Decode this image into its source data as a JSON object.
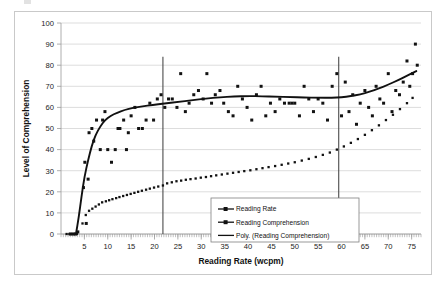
{
  "chart_data": {
    "type": "scatter",
    "title": "",
    "xlabel": "Reading Rate (wcpm)",
    "ylabel": "Level of Comprehension",
    "xlim": [
      0,
      77
    ],
    "ylim": [
      0,
      100
    ],
    "xticks": [
      5,
      10,
      15,
      20,
      25,
      30,
      35,
      40,
      45,
      50,
      55,
      60,
      65,
      70,
      75
    ],
    "yticks": [
      0,
      10,
      20,
      30,
      40,
      50,
      60,
      70,
      80,
      90,
      100
    ],
    "grid": true,
    "legend_position": "inside-bottom-right",
    "legend": [
      "Reading Rate",
      "Reading Comprehension",
      "Poly. (Reading Comprehension)"
    ],
    "annotations": [
      {
        "name": "vertical-reference-line-low",
        "x": 21.8
      },
      {
        "name": "vertical-reference-line-high",
        "x": 59.4
      }
    ],
    "series": [
      {
        "name": "Reading Rate",
        "style": "dotted-markers",
        "points": [
          [
            1.2,
            0
          ],
          [
            1.8,
            0
          ],
          [
            2.3,
            0
          ],
          [
            2.8,
            0
          ],
          [
            3.4,
            0
          ],
          [
            4.6,
            5
          ],
          [
            5.3,
            9
          ],
          [
            6.0,
            11
          ],
          [
            6.7,
            12
          ],
          [
            7.4,
            13
          ],
          [
            8.1,
            14
          ],
          [
            8.8,
            15
          ],
          [
            9.6,
            15.5
          ],
          [
            10.3,
            16
          ],
          [
            11.0,
            16.5
          ],
          [
            11.8,
            17
          ],
          [
            12.5,
            17.5
          ],
          [
            13.3,
            18
          ],
          [
            14.1,
            18.5
          ],
          [
            14.9,
            19
          ],
          [
            15.7,
            19.5
          ],
          [
            16.5,
            20
          ],
          [
            17.3,
            20.5
          ],
          [
            18.2,
            21
          ],
          [
            19.0,
            21.5
          ],
          [
            19.9,
            22
          ],
          [
            20.8,
            22.5
          ],
          [
            21.8,
            23
          ],
          [
            22.7,
            24
          ],
          [
            23.7,
            24.5
          ],
          [
            24.7,
            25
          ],
          [
            25.7,
            25.3
          ],
          [
            26.7,
            25.7
          ],
          [
            27.7,
            26
          ],
          [
            28.8,
            26.3
          ],
          [
            29.9,
            26.7
          ],
          [
            31.0,
            27
          ],
          [
            32.1,
            27.4
          ],
          [
            33.2,
            27.8
          ],
          [
            34.4,
            28.2
          ],
          [
            35.6,
            28.6
          ],
          [
            36.8,
            29
          ],
          [
            38.0,
            29.4
          ],
          [
            39.2,
            29.8
          ],
          [
            40.5,
            30.2
          ],
          [
            41.8,
            30.7
          ],
          [
            43.1,
            31.2
          ],
          [
            44.4,
            31.7
          ],
          [
            45.8,
            32.2
          ],
          [
            47.2,
            32.8
          ],
          [
            48.6,
            33.4
          ],
          [
            50.0,
            34
          ],
          [
            51.5,
            34.8
          ],
          [
            53.0,
            35.6
          ],
          [
            54.5,
            36.5
          ],
          [
            56.0,
            37.5
          ],
          [
            57.5,
            38.6
          ],
          [
            59.0,
            40
          ],
          [
            60.5,
            41.5
          ],
          [
            62.0,
            43.2
          ],
          [
            63.5,
            45
          ],
          [
            65.0,
            47
          ],
          [
            66.5,
            49.2
          ],
          [
            68.0,
            51.5
          ],
          [
            69.5,
            54
          ],
          [
            71.0,
            56.5
          ],
          [
            72.5,
            59.2
          ],
          [
            74.0,
            62
          ],
          [
            75.2,
            64.5
          ]
        ]
      },
      {
        "name": "Reading Comprehension",
        "style": "scatter-markers",
        "points": [
          [
            2.0,
            0
          ],
          [
            2.6,
            0
          ],
          [
            3.1,
            0
          ],
          [
            3.6,
            1
          ],
          [
            4.8,
            22
          ],
          [
            5.1,
            34
          ],
          [
            5.4,
            5
          ],
          [
            5.8,
            26
          ],
          [
            6.0,
            48
          ],
          [
            6.6,
            50
          ],
          [
            7.0,
            44
          ],
          [
            7.6,
            54
          ],
          [
            8.4,
            40
          ],
          [
            8.9,
            54
          ],
          [
            9.4,
            58
          ],
          [
            10.0,
            40
          ],
          [
            10.8,
            34
          ],
          [
            11.6,
            40
          ],
          [
            12.2,
            50
          ],
          [
            12.6,
            50
          ],
          [
            13.4,
            54
          ],
          [
            14.0,
            40
          ],
          [
            14.4,
            48
          ],
          [
            15.0,
            56
          ],
          [
            15.8,
            60
          ],
          [
            16.6,
            50
          ],
          [
            17.4,
            50
          ],
          [
            18.2,
            54
          ],
          [
            19.0,
            62
          ],
          [
            19.8,
            54
          ],
          [
            20.6,
            64
          ],
          [
            21.4,
            66
          ],
          [
            22.2,
            60
          ],
          [
            23.0,
            64
          ],
          [
            23.8,
            64
          ],
          [
            24.8,
            60
          ],
          [
            25.6,
            76
          ],
          [
            26.6,
            58
          ],
          [
            27.4,
            62
          ],
          [
            28.4,
            66
          ],
          [
            29.4,
            68
          ],
          [
            30.4,
            64
          ],
          [
            31.2,
            76
          ],
          [
            32.2,
            62
          ],
          [
            33.0,
            66
          ],
          [
            34.0,
            68
          ],
          [
            34.8,
            62
          ],
          [
            35.8,
            58
          ],
          [
            36.8,
            56
          ],
          [
            37.8,
            70
          ],
          [
            38.8,
            64
          ],
          [
            39.8,
            60
          ],
          [
            40.8,
            54
          ],
          [
            41.8,
            66
          ],
          [
            42.8,
            70
          ],
          [
            43.8,
            56
          ],
          [
            44.8,
            62
          ],
          [
            45.8,
            58
          ],
          [
            46.8,
            64
          ],
          [
            47.8,
            62
          ],
          [
            48.8,
            62
          ],
          [
            49.4,
            62
          ],
          [
            50.0,
            62
          ],
          [
            51.0,
            56
          ],
          [
            52.0,
            70
          ],
          [
            53.0,
            64
          ],
          [
            54.0,
            58
          ],
          [
            55.0,
            64
          ],
          [
            56.0,
            62
          ],
          [
            57.0,
            54
          ],
          [
            58.0,
            70
          ],
          [
            59.0,
            76
          ],
          [
            60.0,
            56
          ],
          [
            60.8,
            72
          ],
          [
            61.6,
            58
          ],
          [
            62.4,
            66
          ],
          [
            63.2,
            52
          ],
          [
            64.0,
            62
          ],
          [
            65.0,
            68
          ],
          [
            65.8,
            60
          ],
          [
            66.6,
            56
          ],
          [
            67.4,
            70
          ],
          [
            68.2,
            64
          ],
          [
            69.0,
            62
          ],
          [
            70.0,
            76
          ],
          [
            70.8,
            58
          ],
          [
            71.6,
            68
          ],
          [
            72.4,
            66
          ],
          [
            73.2,
            72
          ],
          [
            74.0,
            82
          ],
          [
            74.6,
            70
          ],
          [
            75.2,
            76
          ],
          [
            75.8,
            90
          ],
          [
            76.2,
            80
          ]
        ]
      },
      {
        "name": "Poly. (Reading Comprehension)",
        "style": "smooth-line",
        "points": [
          [
            3.2,
            0
          ],
          [
            3.8,
            8
          ],
          [
            4.4,
            18
          ],
          [
            5.0,
            27
          ],
          [
            5.8,
            35
          ],
          [
            6.6,
            42
          ],
          [
            7.4,
            47
          ],
          [
            8.4,
            51
          ],
          [
            9.4,
            54
          ],
          [
            10.6,
            56
          ],
          [
            12.0,
            57.5
          ],
          [
            13.6,
            58.8
          ],
          [
            15.4,
            59.8
          ],
          [
            17.4,
            60.5
          ],
          [
            19.6,
            61.2
          ],
          [
            22.0,
            61.8
          ],
          [
            25.0,
            62.6
          ],
          [
            28.0,
            63.4
          ],
          [
            31.0,
            64.2
          ],
          [
            34.0,
            64.8
          ],
          [
            37.0,
            65.2
          ],
          [
            40.0,
            65.4
          ],
          [
            43.0,
            65.3
          ],
          [
            46.0,
            65.1
          ],
          [
            49.0,
            64.9
          ],
          [
            52.0,
            64.7
          ],
          [
            55.0,
            64.6
          ],
          [
            58.0,
            64.6
          ],
          [
            60.0,
            64.8
          ],
          [
            62.0,
            65.3
          ],
          [
            64.0,
            66.2
          ],
          [
            66.0,
            67.4
          ],
          [
            68.0,
            69.0
          ],
          [
            70.0,
            70.8
          ],
          [
            72.0,
            72.8
          ],
          [
            74.0,
            75.0
          ],
          [
            76.0,
            77.2
          ]
        ]
      }
    ]
  },
  "axes": {
    "y_label": "Level of Comprehension",
    "x_label": "Reading Rate (wcpm)",
    "y_tick_labels": [
      "0",
      "10",
      "20",
      "30",
      "40",
      "50",
      "60",
      "70",
      "80",
      "90",
      "100"
    ],
    "x_tick_labels": [
      "5",
      "10",
      "15",
      "20",
      "25",
      "30",
      "35",
      "40",
      "45",
      "50",
      "55",
      "60",
      "65",
      "70",
      "75"
    ]
  },
  "legend": {
    "items": [
      {
        "label": "Reading Rate",
        "symbol": "line-with-square-marker"
      },
      {
        "label": "Reading Comprehension",
        "symbol": "line-with-square-marker"
      },
      {
        "label": "Poly. (Reading Comprehension)",
        "symbol": "plain-line"
      }
    ]
  },
  "colors": {
    "series": "#121212",
    "grid": "#cfcfcf",
    "axis": "#9a9a9a",
    "reference_line": "#4b4b4b",
    "frame": "#c9c9c9",
    "background": "#ffffff"
  }
}
